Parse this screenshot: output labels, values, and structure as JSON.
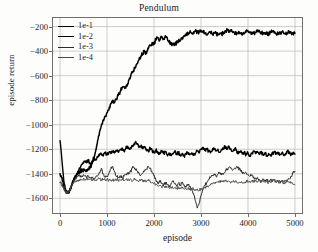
{
  "chart_data": {
    "type": "line",
    "title": "Pendulum",
    "xlabel": "episode",
    "ylabel": "episode return",
    "xlim": [
      -150,
      5150
    ],
    "ylim": [
      -1720,
      -130
    ],
    "xticks": [
      0,
      1000,
      2000,
      3000,
      4000,
      5000
    ],
    "yticks": [
      -200,
      -400,
      -600,
      -800,
      -1000,
      -1200,
      -1400,
      -1600
    ],
    "xtick_labels": [
      "0",
      "1000",
      "2000",
      "3000",
      "4000",
      "5000"
    ],
    "ytick_labels": [
      "−200",
      "−400",
      "−600",
      "−800",
      "−1000",
      "−1200",
      "−1400",
      "−1600"
    ],
    "grid": true,
    "grid_color": "#b9b9b9",
    "frame_color": "#6f6f6f",
    "legend_position": "upper left",
    "legend_frame": false,
    "series": [
      {
        "name": "1e-1",
        "color": "#000000",
        "width": 1.5,
        "x": [
          0,
          40,
          80,
          120,
          160,
          200,
          240,
          280,
          320,
          360,
          400,
          440,
          480,
          520,
          560,
          600,
          640,
          680,
          720,
          760,
          800,
          840,
          880,
          920,
          960,
          1000,
          1040,
          1080,
          1120,
          1160,
          1200,
          1240,
          1280,
          1320,
          1360,
          1400,
          1440,
          1480,
          1520,
          1560,
          1600,
          1640,
          1680,
          1720,
          1760,
          1800,
          1840,
          1880,
          1920,
          1960,
          2000,
          2040,
          2080,
          2120,
          2160,
          2200,
          2240,
          2280,
          2320,
          2360,
          2400,
          2440,
          2480,
          2520,
          2560,
          2600,
          2640,
          2680,
          2720,
          2760,
          2800,
          2840,
          2880,
          2920,
          2960,
          3000,
          3040,
          3080,
          3120,
          3160,
          3200,
          3240,
          3280,
          3320,
          3360,
          3400,
          3440,
          3480,
          3520,
          3560,
          3600,
          3640,
          3680,
          3720,
          3760,
          3800,
          3840,
          3880,
          3920,
          3960,
          4000,
          4040,
          4080,
          4120,
          4160,
          4200,
          4240,
          4280,
          4320,
          4360,
          4400,
          4440,
          4480,
          4520,
          4560,
          4600,
          4640,
          4680,
          4720,
          4760,
          4800,
          4840,
          4880,
          4920,
          4960,
          5000
        ],
        "y": [
          -1400,
          -1430,
          -1510,
          -1545,
          -1555,
          -1540,
          -1500,
          -1455,
          -1420,
          -1400,
          -1385,
          -1375,
          -1370,
          -1372,
          -1368,
          -1360,
          -1345,
          -1320,
          -1280,
          -1210,
          -1130,
          -1060,
          -1005,
          -960,
          -930,
          -905,
          -880,
          -830,
          -800,
          -820,
          -790,
          -760,
          -730,
          -700,
          -690,
          -700,
          -665,
          -620,
          -580,
          -560,
          -530,
          -500,
          -470,
          -440,
          -420,
          -400,
          -420,
          -380,
          -355,
          -330,
          -345,
          -300,
          -290,
          -310,
          -285,
          -300,
          -275,
          -290,
          -320,
          -345,
          -335,
          -350,
          -330,
          -320,
          -310,
          -290,
          -280,
          -265,
          -250,
          -245,
          -255,
          -245,
          -238,
          -250,
          -242,
          -232,
          -236,
          -255,
          -268,
          -252,
          -245,
          -262,
          -250,
          -258,
          -268,
          -255,
          -262,
          -248,
          -235,
          -228,
          -240,
          -232,
          -248,
          -262,
          -250,
          -240,
          -252,
          -268,
          -258,
          -245,
          -238,
          -250,
          -262,
          -255,
          -248,
          -240,
          -232,
          -245,
          -258,
          -250,
          -262,
          -255,
          -248,
          -240,
          -252,
          -262,
          -258,
          -250,
          -243,
          -255,
          -262,
          -250,
          -245,
          -252,
          -258,
          -255
        ]
      },
      {
        "name": "1e-2",
        "color": "#000000",
        "width": 1.4,
        "x": [
          0,
          40,
          80,
          120,
          160,
          200,
          240,
          280,
          320,
          360,
          400,
          440,
          480,
          520,
          560,
          600,
          640,
          680,
          720,
          760,
          800,
          840,
          880,
          920,
          960,
          1000,
          1040,
          1080,
          1120,
          1160,
          1200,
          1240,
          1280,
          1320,
          1360,
          1400,
          1440,
          1480,
          1520,
          1560,
          1600,
          1640,
          1680,
          1720,
          1760,
          1800,
          1840,
          1880,
          1920,
          1960,
          2000,
          2040,
          2080,
          2120,
          2160,
          2200,
          2240,
          2280,
          2320,
          2360,
          2400,
          2440,
          2480,
          2520,
          2560,
          2600,
          2640,
          2680,
          2720,
          2760,
          2800,
          2840,
          2880,
          2920,
          2960,
          3000,
          3040,
          3080,
          3120,
          3160,
          3200,
          3240,
          3280,
          3320,
          3360,
          3400,
          3440,
          3480,
          3520,
          3560,
          3600,
          3640,
          3680,
          3720,
          3760,
          3800,
          3840,
          3880,
          3920,
          3960,
          4000,
          4040,
          4080,
          4120,
          4160,
          4200,
          4240,
          4280,
          4320,
          4360,
          4400,
          4440,
          4480,
          4520,
          4560,
          4600,
          4640,
          4680,
          4720,
          4760,
          4800,
          4840,
          4880,
          4920,
          4960,
          5000
        ],
        "y": [
          -1130,
          -1290,
          -1460,
          -1530,
          -1560,
          -1545,
          -1505,
          -1460,
          -1425,
          -1395,
          -1370,
          -1340,
          -1320,
          -1300,
          -1310,
          -1290,
          -1320,
          -1295,
          -1270,
          -1285,
          -1265,
          -1250,
          -1240,
          -1255,
          -1230,
          -1245,
          -1225,
          -1235,
          -1215,
          -1230,
          -1210,
          -1225,
          -1205,
          -1190,
          -1215,
          -1190,
          -1175,
          -1200,
          -1185,
          -1165,
          -1145,
          -1160,
          -1185,
          -1175,
          -1195,
          -1180,
          -1200,
          -1215,
          -1190,
          -1210,
          -1230,
          -1205,
          -1220,
          -1240,
          -1215,
          -1235,
          -1220,
          -1245,
          -1230,
          -1250,
          -1235,
          -1215,
          -1240,
          -1225,
          -1250,
          -1235,
          -1255,
          -1240,
          -1225,
          -1245,
          -1230,
          -1250,
          -1235,
          -1215,
          -1230,
          -1200,
          -1190,
          -1210,
          -1195,
          -1215,
          -1230,
          -1210,
          -1195,
          -1215,
          -1200,
          -1225,
          -1205,
          -1190,
          -1175,
          -1195,
          -1180,
          -1200,
          -1215,
          -1195,
          -1215,
          -1235,
          -1220,
          -1240,
          -1225,
          -1245,
          -1230,
          -1250,
          -1235,
          -1215,
          -1235,
          -1220,
          -1240,
          -1225,
          -1245,
          -1230,
          -1250,
          -1235,
          -1255,
          -1240,
          -1220,
          -1240,
          -1225,
          -1245,
          -1230,
          -1250,
          -1235,
          -1215,
          -1235,
          -1245,
          -1225,
          -1240
        ]
      },
      {
        "name": "1e-3",
        "color": "#2b2b2b",
        "width": 1.0,
        "x": [
          0,
          40,
          80,
          120,
          160,
          200,
          240,
          280,
          320,
          360,
          400,
          440,
          480,
          520,
          560,
          600,
          640,
          680,
          720,
          760,
          800,
          840,
          880,
          920,
          960,
          1000,
          1040,
          1080,
          1120,
          1160,
          1200,
          1240,
          1280,
          1320,
          1360,
          1400,
          1440,
          1480,
          1520,
          1560,
          1600,
          1640,
          1680,
          1720,
          1760,
          1800,
          1840,
          1880,
          1920,
          1960,
          2000,
          2040,
          2080,
          2120,
          2160,
          2200,
          2240,
          2280,
          2320,
          2360,
          2400,
          2440,
          2480,
          2520,
          2560,
          2600,
          2640,
          2680,
          2720,
          2760,
          2800,
          2840,
          2880,
          2920,
          2960,
          3000,
          3040,
          3080,
          3120,
          3160,
          3200,
          3240,
          3280,
          3320,
          3360,
          3400,
          3440,
          3480,
          3520,
          3560,
          3600,
          3640,
          3680,
          3720,
          3760,
          3800,
          3840,
          3880,
          3920,
          3960,
          4000,
          4040,
          4080,
          4120,
          4160,
          4200,
          4240,
          4280,
          4320,
          4360,
          4400,
          4440,
          4480,
          4520,
          4560,
          4600,
          4640,
          4680,
          4720,
          4760,
          4800,
          4840,
          4880,
          4920,
          4960,
          5000
        ],
        "y": [
          -1470,
          -1480,
          -1520,
          -1550,
          -1560,
          -1540,
          -1505,
          -1470,
          -1445,
          -1430,
          -1420,
          -1415,
          -1425,
          -1415,
          -1430,
          -1420,
          -1435,
          -1425,
          -1440,
          -1430,
          -1420,
          -1390,
          -1355,
          -1400,
          -1430,
          -1420,
          -1400,
          -1360,
          -1340,
          -1385,
          -1420,
          -1430,
          -1415,
          -1430,
          -1420,
          -1410,
          -1400,
          -1390,
          -1370,
          -1345,
          -1360,
          -1380,
          -1395,
          -1410,
          -1395,
          -1380,
          -1360,
          -1340,
          -1355,
          -1390,
          -1420,
          -1450,
          -1480,
          -1455,
          -1475,
          -1500,
          -1470,
          -1490,
          -1510,
          -1485,
          -1460,
          -1480,
          -1500,
          -1475,
          -1495,
          -1470,
          -1490,
          -1510,
          -1485,
          -1505,
          -1520,
          -1560,
          -1620,
          -1680,
          -1640,
          -1580,
          -1530,
          -1500,
          -1470,
          -1450,
          -1430,
          -1415,
          -1400,
          -1420,
          -1405,
          -1390,
          -1410,
          -1395,
          -1380,
          -1360,
          -1345,
          -1355,
          -1370,
          -1355,
          -1340,
          -1355,
          -1370,
          -1385,
          -1400,
          -1390,
          -1405,
          -1420,
          -1410,
          -1425,
          -1440,
          -1430,
          -1445,
          -1455,
          -1440,
          -1455,
          -1445,
          -1460,
          -1450,
          -1465,
          -1455,
          -1470,
          -1460,
          -1475,
          -1465,
          -1480,
          -1470,
          -1455,
          -1440,
          -1420,
          -1395,
          -1380
        ]
      },
      {
        "name": "1e-4",
        "color": "#4a4a4a",
        "width": 0.9,
        "x": [
          0,
          40,
          80,
          120,
          160,
          200,
          240,
          280,
          320,
          360,
          400,
          440,
          480,
          520,
          560,
          600,
          640,
          680,
          720,
          760,
          800,
          840,
          880,
          920,
          960,
          1000,
          1040,
          1080,
          1120,
          1160,
          1200,
          1240,
          1280,
          1320,
          1360,
          1400,
          1440,
          1480,
          1520,
          1560,
          1600,
          1640,
          1680,
          1720,
          1760,
          1800,
          1840,
          1880,
          1920,
          1960,
          2000,
          2040,
          2080,
          2120,
          2160,
          2200,
          2240,
          2280,
          2320,
          2360,
          2400,
          2440,
          2480,
          2520,
          2560,
          2600,
          2640,
          2680,
          2720,
          2760,
          2800,
          2840,
          2880,
          2920,
          2960,
          3000,
          3040,
          3080,
          3120,
          3160,
          3200,
          3240,
          3280,
          3320,
          3360,
          3400,
          3440,
          3480,
          3520,
          3560,
          3600,
          3640,
          3680,
          3720,
          3760,
          3800,
          3840,
          3880,
          3920,
          3960,
          4000,
          4040,
          4080,
          4120,
          4160,
          4200,
          4240,
          4280,
          4320,
          4360,
          4400,
          4440,
          4480,
          4520,
          4560,
          4600,
          4640,
          4680,
          4720,
          4760,
          4800,
          4840,
          4880,
          4920,
          4960,
          5000
        ],
        "y": [
          -1470,
          -1490,
          -1525,
          -1550,
          -1555,
          -1535,
          -1505,
          -1480,
          -1465,
          -1455,
          -1450,
          -1445,
          -1450,
          -1445,
          -1440,
          -1445,
          -1440,
          -1448,
          -1442,
          -1450,
          -1445,
          -1440,
          -1448,
          -1442,
          -1450,
          -1445,
          -1452,
          -1448,
          -1455,
          -1450,
          -1445,
          -1452,
          -1448,
          -1442,
          -1450,
          -1445,
          -1452,
          -1448,
          -1455,
          -1450,
          -1445,
          -1452,
          -1458,
          -1450,
          -1458,
          -1452,
          -1460,
          -1455,
          -1462,
          -1470,
          -1480,
          -1490,
          -1500,
          -1495,
          -1505,
          -1500,
          -1510,
          -1505,
          -1515,
          -1508,
          -1518,
          -1512,
          -1520,
          -1515,
          -1522,
          -1516,
          -1524,
          -1518,
          -1526,
          -1520,
          -1528,
          -1522,
          -1530,
          -1524,
          -1532,
          -1526,
          -1520,
          -1514,
          -1508,
          -1500,
          -1492,
          -1485,
          -1478,
          -1472,
          -1468,
          -1462,
          -1458,
          -1465,
          -1460,
          -1468,
          -1462,
          -1470,
          -1464,
          -1472,
          -1466,
          -1474,
          -1468,
          -1476,
          -1470,
          -1462,
          -1455,
          -1462,
          -1456,
          -1464,
          -1458,
          -1466,
          -1460,
          -1468,
          -1462,
          -1470,
          -1464,
          -1472,
          -1466,
          -1458,
          -1450,
          -1458,
          -1452,
          -1460,
          -1454,
          -1462,
          -1456,
          -1464,
          -1470,
          -1478,
          -1484,
          -1490
        ]
      }
    ]
  },
  "legend": {
    "items": [
      {
        "label": "1e-1"
      },
      {
        "label": "1e-2"
      },
      {
        "label": "1e-3"
      },
      {
        "label": "1e-4"
      }
    ]
  }
}
